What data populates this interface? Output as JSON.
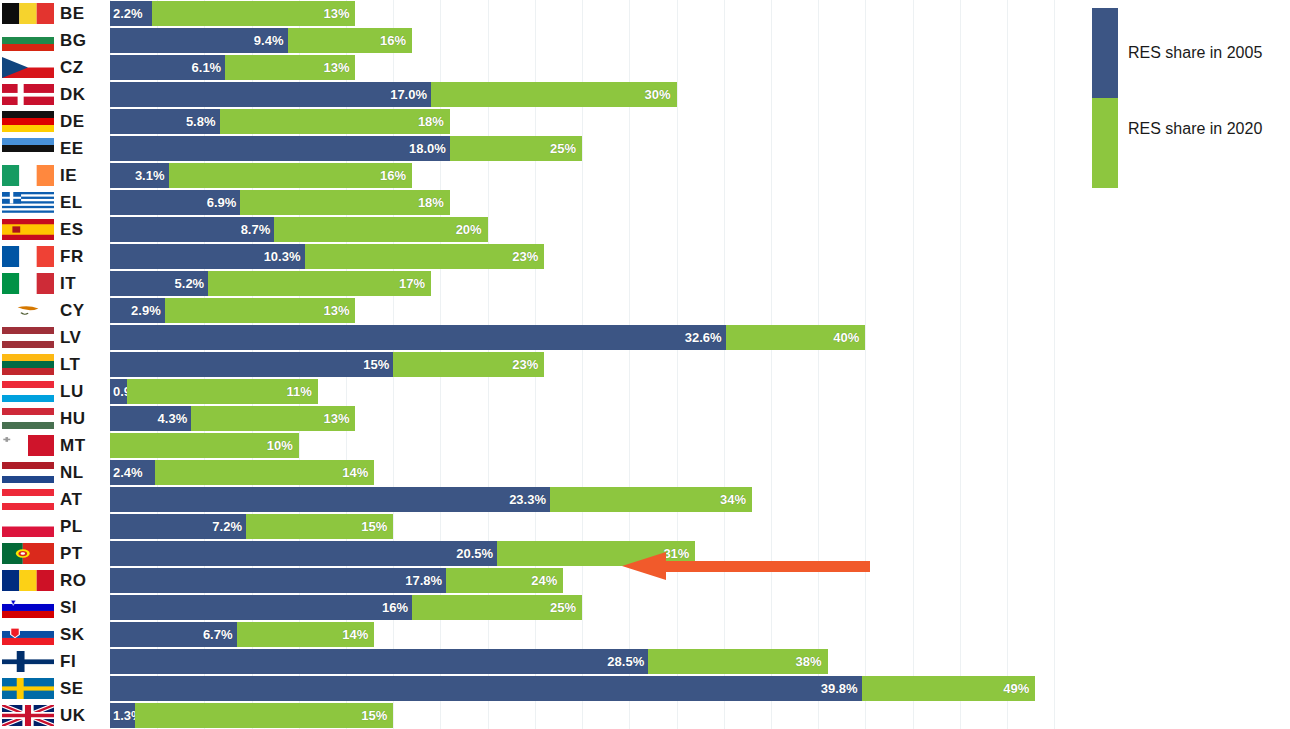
{
  "legend": {
    "series_2005_label": "RES share in 2005",
    "series_2020_label": "RES share in 2020",
    "color_2005": "#3c5584",
    "color_2020": "#8dc63f"
  },
  "annotation": {
    "arrow_name": "left-pointing-arrow",
    "arrow_color": "#f15a2b",
    "points_at_row": "PT"
  },
  "chart_data": {
    "type": "bar",
    "orientation": "horizontal",
    "title": "",
    "subtitle": "",
    "xlabel": "",
    "ylabel": "",
    "xlim": [
      0,
      52
    ],
    "grid": true,
    "legend_position": "right",
    "unit": "%",
    "categories": [
      "BE",
      "BG",
      "CZ",
      "DK",
      "DE",
      "EE",
      "IE",
      "EL",
      "ES",
      "FR",
      "IT",
      "CY",
      "LV",
      "LT",
      "LU",
      "HU",
      "MT",
      "NL",
      "AT",
      "PL",
      "PT",
      "RO",
      "SI",
      "SK",
      "FI",
      "SE",
      "UK"
    ],
    "series": [
      {
        "name": "RES share in 2005",
        "color": "#3c5584",
        "values": [
          2.2,
          9.4,
          6.1,
          17.0,
          5.8,
          18.0,
          3.1,
          6.9,
          8.7,
          10.3,
          5.2,
          2.9,
          32.6,
          15.0,
          0.9,
          4.3,
          0.0,
          2.4,
          23.3,
          7.2,
          20.5,
          17.8,
          16.0,
          6.7,
          28.5,
          39.8,
          1.3
        ],
        "labels": [
          "2.2%",
          "9.4%",
          "6.1%",
          "17.0%",
          "5.8%",
          "18.0%",
          "3.1%",
          "6.9%",
          "8.7%",
          "10.3%",
          "5.2%",
          "2.9%",
          "32.6%",
          "15%",
          "0.9%",
          "4.3%",
          "0%",
          "2.4%",
          "23.3%",
          "7.2%",
          "20.5%",
          "17.8%",
          "16%",
          "6.7%",
          "28.5%",
          "39.8%",
          "1.3%"
        ]
      },
      {
        "name": "RES share in 2020",
        "color": "#8dc63f",
        "values": [
          13,
          16,
          13,
          30,
          18,
          25,
          16,
          18,
          20,
          23,
          17,
          13,
          40,
          23,
          11,
          13,
          10,
          14,
          34,
          15,
          31,
          24,
          25,
          14,
          38,
          49,
          15
        ],
        "labels": [
          "13%",
          "16%",
          "13%",
          "30%",
          "18%",
          "25%",
          "16%",
          "18%",
          "20%",
          "23%",
          "17%",
          "13%",
          "40%",
          "23%",
          "11%",
          "13%",
          "10%",
          "14%",
          "34%",
          "15%",
          "31%",
          "24%",
          "25%",
          "14%",
          "38%",
          "49%",
          "15%"
        ]
      }
    ],
    "rows": [
      {
        "code": "BE",
        "flag": "flag-be",
        "v2005": 2.2,
        "l2005": "2.2%",
        "v2020": 13,
        "l2020": "13%"
      },
      {
        "code": "BG",
        "flag": "flag-bg",
        "v2005": 9.4,
        "l2005": "9.4%",
        "v2020": 16,
        "l2020": "16%"
      },
      {
        "code": "CZ",
        "flag": "flag-cz",
        "v2005": 6.1,
        "l2005": "6.1%",
        "v2020": 13,
        "l2020": "13%"
      },
      {
        "code": "DK",
        "flag": "flag-dk",
        "v2005": 17.0,
        "l2005": "17.0%",
        "v2020": 30,
        "l2020": "30%"
      },
      {
        "code": "DE",
        "flag": "flag-de",
        "v2005": 5.8,
        "l2005": "5.8%",
        "v2020": 18,
        "l2020": "18%"
      },
      {
        "code": "EE",
        "flag": "flag-ee",
        "v2005": 18.0,
        "l2005": "18.0%",
        "v2020": 25,
        "l2020": "25%"
      },
      {
        "code": "IE",
        "flag": "flag-ie",
        "v2005": 3.1,
        "l2005": "3.1%",
        "v2020": 16,
        "l2020": "16%"
      },
      {
        "code": "EL",
        "flag": "flag-el",
        "v2005": 6.9,
        "l2005": "6.9%",
        "v2020": 18,
        "l2020": "18%"
      },
      {
        "code": "ES",
        "flag": "flag-es",
        "v2005": 8.7,
        "l2005": "8.7%",
        "v2020": 20,
        "l2020": "20%"
      },
      {
        "code": "FR",
        "flag": "flag-fr",
        "v2005": 10.3,
        "l2005": "10.3%",
        "v2020": 23,
        "l2020": "23%"
      },
      {
        "code": "IT",
        "flag": "flag-it",
        "v2005": 5.2,
        "l2005": "5.2%",
        "v2020": 17,
        "l2020": "17%"
      },
      {
        "code": "CY",
        "flag": "flag-cy",
        "v2005": 2.9,
        "l2005": "2.9%",
        "v2020": 13,
        "l2020": "13%"
      },
      {
        "code": "LV",
        "flag": "flag-lv",
        "v2005": 32.6,
        "l2005": "32.6%",
        "v2020": 40,
        "l2020": "40%"
      },
      {
        "code": "LT",
        "flag": "flag-lt",
        "v2005": 15.0,
        "l2005": "15%",
        "v2020": 23,
        "l2020": "23%"
      },
      {
        "code": "LU",
        "flag": "flag-lu",
        "v2005": 0.9,
        "l2005": "0.9%",
        "v2020": 11,
        "l2020": "11%"
      },
      {
        "code": "HU",
        "flag": "flag-hu",
        "v2005": 4.3,
        "l2005": "4.3%",
        "v2020": 13,
        "l2020": "13%"
      },
      {
        "code": "MT",
        "flag": "flag-mt",
        "v2005": 0.0,
        "l2005": "0%",
        "v2020": 10,
        "l2020": "10%"
      },
      {
        "code": "NL",
        "flag": "flag-nl",
        "v2005": 2.4,
        "l2005": "2.4%",
        "v2020": 14,
        "l2020": "14%"
      },
      {
        "code": "AT",
        "flag": "flag-at",
        "v2005": 23.3,
        "l2005": "23.3%",
        "v2020": 34,
        "l2020": "34%"
      },
      {
        "code": "PL",
        "flag": "flag-pl",
        "v2005": 7.2,
        "l2005": "7.2%",
        "v2020": 15,
        "l2020": "15%"
      },
      {
        "code": "PT",
        "flag": "flag-pt",
        "v2005": 20.5,
        "l2005": "20.5%",
        "v2020": 31,
        "l2020": "31%"
      },
      {
        "code": "RO",
        "flag": "flag-ro",
        "v2005": 17.8,
        "l2005": "17.8%",
        "v2020": 24,
        "l2020": "24%"
      },
      {
        "code": "SI",
        "flag": "flag-si",
        "v2005": 16.0,
        "l2005": "16%",
        "v2020": 25,
        "l2020": "25%"
      },
      {
        "code": "SK",
        "flag": "flag-sk",
        "v2005": 6.7,
        "l2005": "6.7%",
        "v2020": 14,
        "l2020": "14%"
      },
      {
        "code": "FI",
        "flag": "flag-fi",
        "v2005": 28.5,
        "l2005": "28.5%",
        "v2020": 38,
        "l2020": "38%"
      },
      {
        "code": "SE",
        "flag": "flag-se",
        "v2005": 39.8,
        "l2005": "39.8%",
        "v2020": 49,
        "l2020": "49%"
      },
      {
        "code": "UK",
        "flag": "flag-uk",
        "v2005": 1.3,
        "l2005": "1.3%",
        "v2020": 15,
        "l2020": "15%"
      }
    ]
  }
}
